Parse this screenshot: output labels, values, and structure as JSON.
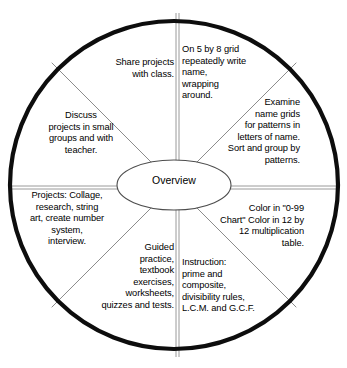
{
  "diagram": {
    "title": "Overview",
    "shape": "circular-wheel",
    "sector_count": 8,
    "colors": {
      "outer_circle_stroke": "#000000",
      "divider_stroke": "#8c8c8c",
      "center_ellipse_stroke": "#555555",
      "background": "#ffffff",
      "text": "#000000"
    },
    "center": {
      "label": "Overview"
    },
    "sectors": [
      {
        "id": "share-projects",
        "position": "top-left-upper",
        "align": "right",
        "text": "Share projects\nwith class."
      },
      {
        "id": "name-grid",
        "position": "top-right-upper",
        "align": "left",
        "text": "On 5 by 8 grid\nrepeatedly write\nname,\nwrapping\naround."
      },
      {
        "id": "examine-patterns",
        "position": "right-upper",
        "align": "right",
        "text": "Examine\nname grids\nfor patterns in\nletters of name.\nSort and group by\npatterns."
      },
      {
        "id": "color-charts",
        "position": "right-lower",
        "align": "right",
        "text": "Color in \"0-99\nChart\" Color in 12 by\n12 multiplication\ntable."
      },
      {
        "id": "instruction",
        "position": "bottom-right-lower",
        "align": "left",
        "text": "Instruction:\nprime and\ncomposite,\ndivisibility rules,\nL.C.M. and G.C.F."
      },
      {
        "id": "guided-practice",
        "position": "bottom-left-lower",
        "align": "right",
        "text": "Guided\npractice,\ntextbook\nexercises,\nworksheets,\nquizzes and tests."
      },
      {
        "id": "projects",
        "position": "left-lower",
        "align": "center",
        "text": "Projects:  Collage,\nresearch, string\nart, create number\nsystem,\ninterview."
      },
      {
        "id": "discuss",
        "position": "left-upper",
        "align": "center",
        "text": "Discuss\nprojects in small\ngroups and with\nteacher."
      }
    ]
  }
}
